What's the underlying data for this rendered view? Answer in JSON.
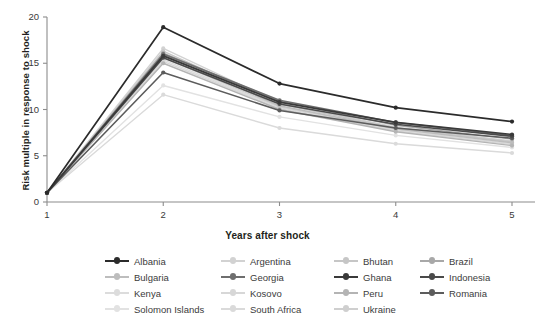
{
  "chart_data": {
    "type": "line",
    "title": "",
    "xlabel": "Years after shock",
    "ylabel": "Risk multiple in response to shock",
    "x": [
      1,
      2,
      3,
      4,
      5
    ],
    "xticklabels": [
      "1",
      "2",
      "3",
      "4",
      "5"
    ],
    "yticklabels": [
      "0",
      "5",
      "10",
      "15",
      "20"
    ],
    "yticks": [
      0,
      5,
      10,
      15,
      20
    ],
    "xlim": [
      1,
      5
    ],
    "ylim": [
      0,
      20
    ],
    "grid": false,
    "legend_position": "bottom",
    "legend_columns": 4,
    "markers": "circle",
    "series": [
      {
        "name": "Albania",
        "color": "#2b2b2b",
        "width": 1.7,
        "values": [
          1.0,
          18.9,
          12.8,
          10.2,
          8.7
        ]
      },
      {
        "name": "Argentina",
        "color": "#d2d2d2",
        "width": 1.4,
        "values": [
          1.0,
          16.6,
          10.7,
          8.1,
          6.6
        ]
      },
      {
        "name": "Bhutan",
        "color": "#c6c6c6",
        "width": 1.4,
        "values": [
          1.0,
          16.3,
          10.6,
          8.0,
          6.5
        ]
      },
      {
        "name": "Brazil",
        "color": "#a8a8a8",
        "width": 1.4,
        "values": [
          1.0,
          16.1,
          10.9,
          8.3,
          6.8
        ]
      },
      {
        "name": "Bulgaria",
        "color": "#bdbdbd",
        "width": 1.4,
        "values": [
          1.0,
          15.9,
          10.4,
          7.9,
          6.4
        ]
      },
      {
        "name": "Georgia",
        "color": "#6e6e6e",
        "width": 1.5,
        "values": [
          1.0,
          16.0,
          11.0,
          8.6,
          7.2
        ]
      },
      {
        "name": "Ghana",
        "color": "#3a3a3a",
        "width": 1.7,
        "values": [
          1.0,
          15.8,
          10.8,
          8.6,
          7.3
        ]
      },
      {
        "name": "Indonesia",
        "color": "#4a4a4a",
        "width": 1.6,
        "values": [
          1.0,
          15.6,
          10.6,
          8.4,
          7.1
        ]
      },
      {
        "name": "Kenya",
        "color": "#dcdcdc",
        "width": 1.4,
        "values": [
          1.0,
          15.4,
          10.2,
          7.8,
          6.3
        ]
      },
      {
        "name": "Kosovo",
        "color": "#d7d7d7",
        "width": 1.4,
        "values": [
          1.0,
          15.2,
          10.1,
          7.7,
          6.2
        ]
      },
      {
        "name": "Peru",
        "color": "#b4b4b4",
        "width": 1.4,
        "values": [
          1.0,
          15.0,
          10.0,
          7.6,
          6.1
        ]
      },
      {
        "name": "Romania",
        "color": "#5c5c5c",
        "width": 1.6,
        "values": [
          1.0,
          14.0,
          9.9,
          8.0,
          6.9
        ]
      },
      {
        "name": "Solomon Islands",
        "color": "#e2e2e2",
        "width": 1.4,
        "values": [
          1.0,
          12.6,
          9.2,
          7.2,
          5.9
        ]
      },
      {
        "name": "South Africa",
        "color": "#dadada",
        "width": 1.4,
        "values": [
          1.0,
          11.6,
          8.0,
          6.3,
          5.3
        ]
      },
      {
        "name": "Ukraine",
        "color": "#cfcfcf",
        "width": 1.4,
        "values": [
          1.0,
          15.6,
          10.3,
          7.9,
          6.5
        ]
      }
    ]
  },
  "axis": {
    "y_title": "Risk multiple in response to shock",
    "x_title": "Years after shock",
    "y_ticks": [
      "20",
      "15",
      "10",
      "5",
      "0"
    ],
    "x_ticks": [
      "1",
      "2",
      "3",
      "4",
      "5"
    ]
  },
  "legend": {
    "rows": [
      [
        {
          "label": "Albania",
          "color": "#2b2b2b"
        },
        {
          "label": "Argentina",
          "color": "#d2d2d2"
        },
        {
          "label": "Bhutan",
          "color": "#c6c6c6"
        },
        {
          "label": "Brazil",
          "color": "#a8a8a8"
        }
      ],
      [
        {
          "label": "Bulgaria",
          "color": "#bdbdbd"
        },
        {
          "label": "Georgia",
          "color": "#6e6e6e"
        },
        {
          "label": "Ghana",
          "color": "#3a3a3a"
        },
        {
          "label": "Indonesia",
          "color": "#4a4a4a"
        }
      ],
      [
        {
          "label": "Kenya",
          "color": "#dcdcdc"
        },
        {
          "label": "Kosovo",
          "color": "#d7d7d7"
        },
        {
          "label": "Peru",
          "color": "#b4b4b4"
        },
        {
          "label": "Romania",
          "color": "#5c5c5c"
        }
      ],
      [
        {
          "label": "Solomon Islands",
          "color": "#e2e2e2"
        },
        {
          "label": "South Africa",
          "color": "#dadada"
        },
        {
          "label": "Ukraine",
          "color": "#cfcfcf"
        }
      ]
    ]
  },
  "style": {
    "axis_color": "#8c8c8c",
    "text_color": "#231f20",
    "tick_text_color": "#3a3a3a",
    "background": "#ffffff"
  }
}
